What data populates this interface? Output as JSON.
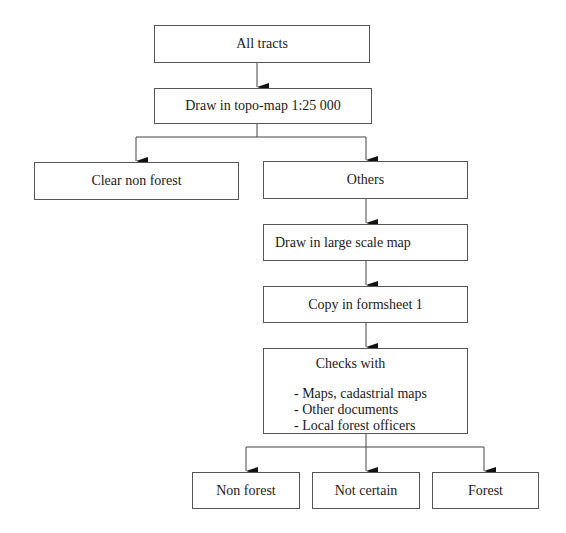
{
  "diagram": {
    "type": "flowchart",
    "nodes": [
      {
        "id": "all_tracts",
        "label": "All tracts"
      },
      {
        "id": "topo_map",
        "label": "Draw in topo-map 1:25 000"
      },
      {
        "id": "clear_non_forest",
        "label": "Clear non forest"
      },
      {
        "id": "others",
        "label": "Others"
      },
      {
        "id": "large_scale_map",
        "label": "Draw in large scale map"
      },
      {
        "id": "formsheet",
        "label": "Copy in formsheet 1"
      },
      {
        "id": "checks",
        "label": "Checks with",
        "items": [
          "- Maps, cadastrial maps",
          "- Other documents",
          "- Local forest officers"
        ]
      },
      {
        "id": "non_forest",
        "label": "Non forest"
      },
      {
        "id": "not_certain",
        "label": "Not certain"
      },
      {
        "id": "forest",
        "label": "Forest"
      }
    ],
    "edges": [
      [
        "all_tracts",
        "topo_map"
      ],
      [
        "topo_map",
        "clear_non_forest"
      ],
      [
        "topo_map",
        "others"
      ],
      [
        "others",
        "large_scale_map"
      ],
      [
        "large_scale_map",
        "formsheet"
      ],
      [
        "formsheet",
        "checks"
      ],
      [
        "checks",
        "non_forest"
      ],
      [
        "checks",
        "not_certain"
      ],
      [
        "checks",
        "forest"
      ]
    ]
  }
}
